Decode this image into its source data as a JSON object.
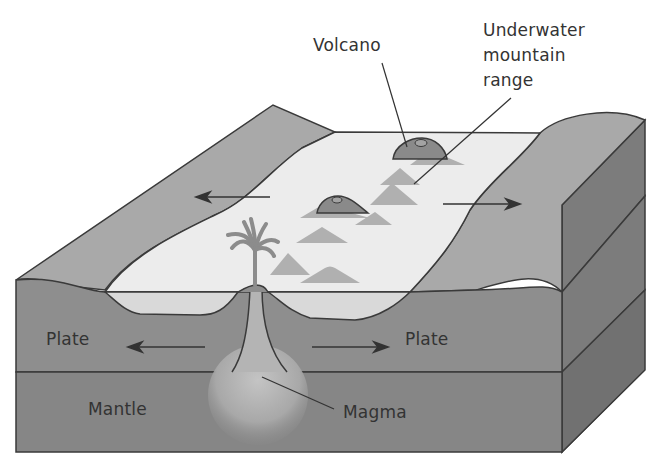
{
  "diagram": {
    "type": "cross-section block diagram",
    "labels": {
      "volcano": "Volcano",
      "mountain_range": "Underwater\nmountain\nrange",
      "plate_left": "Plate",
      "plate_right": "Plate",
      "mantle": "Mantle",
      "magma": "Magma"
    },
    "arrows": [
      {
        "name": "surface-left",
        "direction": "left"
      },
      {
        "name": "surface-right",
        "direction": "right"
      },
      {
        "name": "plate-left",
        "direction": "left"
      },
      {
        "name": "plate-right",
        "direction": "right"
      }
    ],
    "colors": {
      "background": "#ffffff",
      "outline": "#3a3a3a",
      "ocean": "#ececec",
      "ocean_side": "#d9d9d9",
      "land_top": "#a9a9a9",
      "plate_front": "#8e8e8e",
      "mantle_front": "#868686",
      "side_face_upper": "#7c7c7c",
      "side_face_lower": "#747474",
      "magma": "#b4b4b4",
      "seamount": "#b0b0b0",
      "volcano": "#8a8a8a"
    }
  }
}
